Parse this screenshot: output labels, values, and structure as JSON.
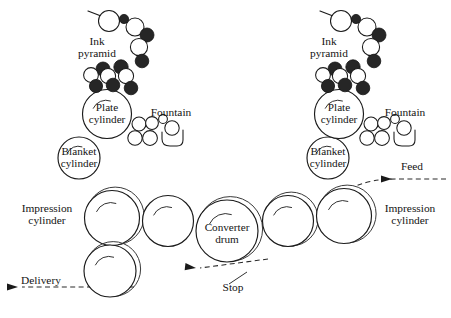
{
  "figure": {
    "background_color": "#ffffff",
    "ink_color": "#141414",
    "roller_rubber_color": "#262626",
    "roller_metal_color": "#ffffff",
    "width": 451,
    "height": 318
  },
  "labels": {
    "ink_pyramid_line1": "Ink",
    "ink_pyramid_line2": "pyramid",
    "plate_cylinder_line1": "Plate",
    "plate_cylinder_line2": "cylinder",
    "blanket_cylinder_line1": "Blanket",
    "blanket_cylinder_line2": "cylinder",
    "impression_cylinder_line1": "Impression",
    "impression_cylinder_line2": "cylinder",
    "converter_drum_line1": "Converter",
    "converter_drum_line2": "drum",
    "fountain": "Fountain",
    "feed": "Feed",
    "delivery": "Delivery",
    "stop": "Stop"
  },
  "label_positions": {
    "left_ink_pyramid": {
      "x": 97,
      "y": 45,
      "anchor": "middle"
    },
    "right_ink_pyramid": {
      "x": 329,
      "y": 45,
      "anchor": "middle"
    },
    "left_plate": {
      "x": 107,
      "y": 111,
      "anchor": "middle"
    },
    "right_plate": {
      "x": 339,
      "y": 111,
      "anchor": "middle"
    },
    "left_blanket": {
      "x": 79,
      "y": 155,
      "anchor": "middle"
    },
    "right_blanket": {
      "x": 328,
      "y": 155,
      "anchor": "middle"
    },
    "left_fountain": {
      "x": 171,
      "y": 116,
      "anchor": "middle"
    },
    "right_fountain": {
      "x": 405,
      "y": 116,
      "anchor": "middle"
    },
    "left_impression": {
      "x": 47,
      "y": 212,
      "anchor": "middle"
    },
    "right_impression": {
      "x": 410,
      "y": 212,
      "anchor": "middle"
    },
    "converter_drum": {
      "x": 227,
      "y": 231,
      "anchor": "middle"
    },
    "feed": {
      "x": 412,
      "y": 170,
      "anchor": "middle"
    },
    "delivery": {
      "x": 41,
      "y": 284,
      "anchor": "middle"
    },
    "stop": {
      "x": 233,
      "y": 291,
      "anchor": "middle"
    }
  },
  "cylinders": {
    "left_plate": {
      "cx": 107,
      "cy": 114,
      "r": 24.5,
      "ghost": false
    },
    "left_blanket": {
      "cx": 79,
      "cy": 158,
      "r": 21.0,
      "ghost": false
    },
    "left_impression": {
      "cx": 112,
      "cy": 218,
      "r": 27.5,
      "ghost": true
    },
    "left_transfer": {
      "cx": 168,
      "cy": 221,
      "r": 25.5,
      "ghost": false
    },
    "delivery_drum": {
      "cx": 110,
      "cy": 271,
      "r": 26.0,
      "ghost": true
    },
    "converter_drum": {
      "cx": 227,
      "cy": 231,
      "r": 31.0,
      "ghost": true
    },
    "right_transfer": {
      "cx": 288,
      "cy": 221,
      "r": 25.5,
      "ghost": true
    },
    "right_impression": {
      "cx": 344,
      "cy": 216,
      "r": 27.5,
      "ghost": true
    },
    "right_blanket": {
      "cx": 328,
      "cy": 158,
      "r": 21.0,
      "ghost": false
    },
    "right_plate": {
      "cx": 339,
      "cy": 114,
      "r": 24.5,
      "ghost": false
    }
  },
  "units": [
    {
      "name": "left-printing-unit",
      "origin_x": 0,
      "ink_pyramid_rollers": [
        {
          "cx": 109,
          "cy": 21,
          "r": 10.5,
          "type": "metal"
        },
        {
          "cx": 124,
          "cy": 19,
          "r": 4.6,
          "type": "rubber"
        },
        {
          "cx": 135,
          "cy": 27,
          "r": 9.0,
          "type": "metal"
        },
        {
          "cx": 147,
          "cy": 35,
          "r": 7.0,
          "type": "rubber"
        },
        {
          "cx": 139,
          "cy": 47,
          "r": 8.6,
          "type": "metal"
        },
        {
          "cx": 142,
          "cy": 61,
          "r": 6.8,
          "type": "rubber"
        },
        {
          "cx": 103,
          "cy": 69,
          "r": 7.0,
          "type": "rubber"
        },
        {
          "cx": 121,
          "cy": 67,
          "r": 7.2,
          "type": "rubber"
        },
        {
          "cx": 91,
          "cy": 75,
          "r": 7.4,
          "type": "metal"
        },
        {
          "cx": 108,
          "cy": 76,
          "r": 7.6,
          "type": "metal"
        },
        {
          "cx": 126,
          "cy": 76,
          "r": 7.6,
          "type": "metal"
        },
        {
          "cx": 96,
          "cy": 86,
          "r": 6.6,
          "type": "rubber"
        },
        {
          "cx": 113,
          "cy": 85,
          "r": 6.8,
          "type": "rubber"
        },
        {
          "cx": 131,
          "cy": 88,
          "r": 6.8,
          "type": "rubber"
        }
      ],
      "feed_arm": {
        "x1": 88,
        "y1": 11,
        "x2": 101,
        "y2": 16
      },
      "fountain": {
        "rollers": [
          {
            "cx": 139,
            "cy": 124,
            "r": 7.0,
            "type": "metal"
          },
          {
            "cx": 152,
            "cy": 123,
            "r": 6.4,
            "type": "metal"
          },
          {
            "cx": 135,
            "cy": 138,
            "r": 7.2,
            "type": "metal"
          },
          {
            "cx": 150,
            "cy": 138,
            "r": 7.4,
            "type": "metal"
          },
          {
            "cx": 163,
            "cy": 119,
            "r": 4.4,
            "type": "metal"
          },
          {
            "cx": 172,
            "cy": 128,
            "r": 7.2,
            "type": "metal"
          }
        ],
        "trough_path": "M 162 132 L 162 139 Q 162 146 170 146 L 177 146 Q 183 146 183 140 L 183 130"
      }
    },
    {
      "name": "right-printing-unit",
      "origin_x": 232,
      "ink_pyramid_rollers": [
        {
          "cx": 341,
          "cy": 21,
          "r": 10.5,
          "type": "metal"
        },
        {
          "cx": 356,
          "cy": 19,
          "r": 4.6,
          "type": "rubber"
        },
        {
          "cx": 367,
          "cy": 27,
          "r": 9.0,
          "type": "metal"
        },
        {
          "cx": 379,
          "cy": 35,
          "r": 7.0,
          "type": "rubber"
        },
        {
          "cx": 371,
          "cy": 47,
          "r": 8.6,
          "type": "metal"
        },
        {
          "cx": 374,
          "cy": 61,
          "r": 6.8,
          "type": "rubber"
        },
        {
          "cx": 335,
          "cy": 69,
          "r": 7.0,
          "type": "rubber"
        },
        {
          "cx": 353,
          "cy": 67,
          "r": 7.2,
          "type": "rubber"
        },
        {
          "cx": 323,
          "cy": 75,
          "r": 7.4,
          "type": "metal"
        },
        {
          "cx": 340,
          "cy": 76,
          "r": 7.6,
          "type": "metal"
        },
        {
          "cx": 358,
          "cy": 76,
          "r": 7.6,
          "type": "metal"
        },
        {
          "cx": 328,
          "cy": 86,
          "r": 6.6,
          "type": "rubber"
        },
        {
          "cx": 345,
          "cy": 85,
          "r": 6.8,
          "type": "rubber"
        },
        {
          "cx": 363,
          "cy": 88,
          "r": 6.8,
          "type": "rubber"
        }
      ],
      "feed_arm": {
        "x1": 320,
        "y1": 11,
        "x2": 333,
        "y2": 16
      },
      "fountain": {
        "rollers": [
          {
            "cx": 371,
            "cy": 124,
            "r": 7.0,
            "type": "metal"
          },
          {
            "cx": 384,
            "cy": 123,
            "r": 6.4,
            "type": "metal"
          },
          {
            "cx": 367,
            "cy": 138,
            "r": 7.2,
            "type": "metal"
          },
          {
            "cx": 382,
            "cy": 138,
            "r": 7.4,
            "type": "metal"
          },
          {
            "cx": 395,
            "cy": 119,
            "r": 4.4,
            "type": "metal"
          },
          {
            "cx": 404,
            "cy": 128,
            "r": 7.2,
            "type": "metal"
          }
        ],
        "trough_path": "M 394 132 L 394 139 Q 394 146 402 146 L 409 146 Q 415 146 415 140 L 415 130"
      }
    }
  ],
  "paper_path": {
    "feed_segment": "M 446 179 L 396 179 Q 372 179 356 186",
    "transfer_segment": "M 268 259 L 200 268",
    "delivery_segment": "M 134 287 L 22 287",
    "stop_leader": "M 229 284 L 247 272"
  },
  "arrows": [
    {
      "name": "feed-arrow",
      "tip_x": 392,
      "tip_y": 179,
      "angle": 180
    },
    {
      "name": "transfer-arrow",
      "tip_x": 196,
      "tip_y": 268,
      "angle": 187
    },
    {
      "name": "delivery-arrow",
      "tip_x": 18,
      "tip_y": 287,
      "angle": 180
    }
  ]
}
